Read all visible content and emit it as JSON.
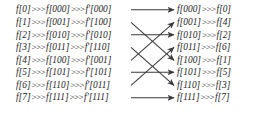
{
  "figure": {
    "name": "bit-reversal-permutation-diagram",
    "stroke_color": "#3a3a3a",
    "text_color": "#1c1c1c",
    "background": "#ffffff",
    "operator": ">>>"
  },
  "left_column": {
    "rows": [
      {
        "index": "f[0]",
        "binary": "f[000]",
        "mapped": "f'[000]"
      },
      {
        "index": "f[1]",
        "binary": "f[001]",
        "mapped": "f'[100]"
      },
      {
        "index": "f[2]",
        "binary": "f[010]",
        "mapped": "f'[010]"
      },
      {
        "index": "f[3]",
        "binary": "f[011]",
        "mapped": "f'[110]"
      },
      {
        "index": "f[4]",
        "binary": "f[100]",
        "mapped": "f'[001]"
      },
      {
        "index": "f[5]",
        "binary": "f[101]",
        "mapped": "f'[101]"
      },
      {
        "index": "f[6]",
        "binary": "f[110]",
        "mapped": "f'[011]"
      },
      {
        "index": "f[7]",
        "binary": "f[111]",
        "mapped": "f'[111]"
      }
    ]
  },
  "right_column": {
    "rows": [
      {
        "binary": "f[000]",
        "index": "f[0]"
      },
      {
        "binary": "f[001]",
        "index": "f[4]"
      },
      {
        "binary": "f[010]",
        "index": "f[2]"
      },
      {
        "binary": "f[011]",
        "index": "f[6]"
      },
      {
        "binary": "f[100]",
        "index": "f[1]"
      },
      {
        "binary": "f[101]",
        "index": "f[5]"
      },
      {
        "binary": "f[110]",
        "index": "f[3]"
      },
      {
        "binary": "f[111]",
        "index": "f[7]"
      }
    ]
  },
  "connections": [
    {
      "from_row": 0,
      "to_row": 0,
      "kind": "straight"
    },
    {
      "from_row": 1,
      "to_row": 4,
      "kind": "diagonal"
    },
    {
      "from_row": 2,
      "to_row": 2,
      "kind": "straight"
    },
    {
      "from_row": 3,
      "to_row": 6,
      "kind": "diagonal"
    },
    {
      "from_row": 4,
      "to_row": 1,
      "kind": "diagonal"
    },
    {
      "from_row": 5,
      "to_row": 5,
      "kind": "straight"
    },
    {
      "from_row": 6,
      "to_row": 3,
      "kind": "diagonal"
    },
    {
      "from_row": 7,
      "to_row": 7,
      "kind": "straight"
    }
  ]
}
